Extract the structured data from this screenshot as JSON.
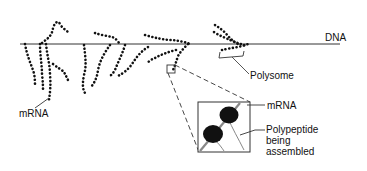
{
  "diagram": {
    "labels": {
      "dna": "DNA",
      "polysome": "Polysome",
      "mrna_left": "mRNA",
      "mrna_inset": "mRNA",
      "polypeptide_line1": "Polypeptide",
      "polypeptide_line2": "being",
      "polypeptide_line3": "assembled"
    },
    "colors": {
      "ink": "#111111",
      "background": "#ffffff",
      "strand_gray": "#888888"
    }
  }
}
